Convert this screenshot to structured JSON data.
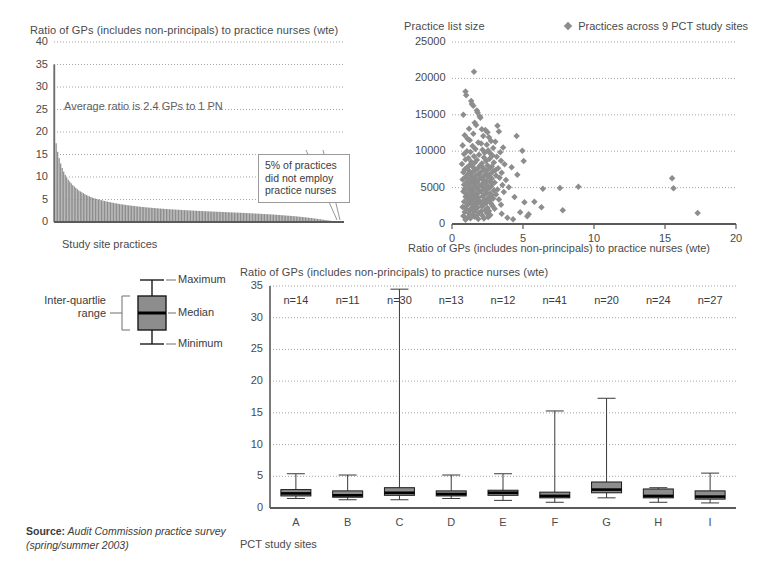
{
  "source": {
    "label": "Source:",
    "text": " Audit Commission practice survey",
    "line2": "(spring/summer 2003)"
  },
  "boxplot_legend": {
    "maximum": "Maximum",
    "median": "Median",
    "minimum": "Minimum",
    "iqr_line1": "Inter-quartlie",
    "iqr_line2": "range"
  },
  "chart_data": [
    {
      "id": "gp-pn-ratio-distribution",
      "type": "bar",
      "title": "Ratio of GPs (includes non-principals) to practice nurses (wte)",
      "xlabel": "Study site practices",
      "ylabel": "",
      "ylim": [
        0,
        40
      ],
      "yticks": [
        0,
        5,
        10,
        15,
        20,
        25,
        30,
        35,
        40
      ],
      "grid": true,
      "annotation": "Average ratio is 2.4 GPs to 1 PN",
      "callout": "5% of practices\ndid not employ\npractice nurses",
      "bar_color": "#8d8d8d",
      "n_bars": 192,
      "values": [
        35.0,
        17.5,
        15.6,
        14.2,
        13.0,
        12.0,
        11.2,
        10.5,
        9.9,
        9.4,
        9.0,
        8.6,
        8.2,
        7.9,
        7.6,
        7.3,
        7.0,
        6.8,
        6.6,
        6.4,
        6.2,
        6.0,
        5.85,
        5.7,
        5.55,
        5.4,
        5.3,
        5.2,
        5.1,
        5.0,
        4.92,
        4.84,
        4.76,
        4.68,
        4.6,
        4.52,
        4.45,
        4.38,
        4.31,
        4.24,
        4.18,
        4.12,
        4.06,
        4.0,
        3.95,
        3.9,
        3.85,
        3.8,
        3.75,
        3.7,
        3.66,
        3.62,
        3.58,
        3.54,
        3.5,
        3.46,
        3.42,
        3.38,
        3.35,
        3.32,
        3.28,
        3.25,
        3.22,
        3.19,
        3.16,
        3.13,
        3.1,
        3.07,
        3.04,
        3.01,
        2.99,
        2.96,
        2.94,
        2.91,
        2.89,
        2.86,
        2.84,
        2.82,
        2.8,
        2.78,
        2.76,
        2.74,
        2.72,
        2.7,
        2.68,
        2.66,
        2.64,
        2.62,
        2.6,
        2.58,
        2.56,
        2.55,
        2.53,
        2.51,
        2.5,
        2.48,
        2.46,
        2.45,
        2.43,
        2.42,
        2.4,
        2.38,
        2.37,
        2.35,
        2.34,
        2.32,
        2.31,
        2.29,
        2.28,
        2.26,
        2.25,
        2.23,
        2.22,
        2.2,
        2.19,
        2.17,
        2.16,
        2.14,
        2.13,
        2.11,
        2.1,
        2.08,
        2.07,
        2.05,
        2.04,
        2.02,
        2.0,
        1.99,
        1.97,
        1.95,
        1.94,
        1.92,
        1.9,
        1.88,
        1.87,
        1.85,
        1.83,
        1.81,
        1.79,
        1.77,
        1.75,
        1.73,
        1.71,
        1.69,
        1.67,
        1.65,
        1.62,
        1.6,
        1.58,
        1.55,
        1.53,
        1.5,
        1.48,
        1.45,
        1.42,
        1.4,
        1.37,
        1.34,
        1.31,
        1.28,
        1.25,
        1.22,
        1.18,
        1.15,
        1.11,
        1.08,
        1.04,
        1.0,
        0.96,
        0.92,
        0.88,
        0.84,
        0.8,
        0.75,
        0.7,
        0.66,
        0.61,
        0.56,
        0.51,
        0.46,
        0.41,
        0.36,
        0.31,
        0.26,
        0.21,
        0.16,
        0.12,
        0.08,
        0.0,
        0.0,
        0.0,
        0.0
      ]
    },
    {
      "id": "list-size-vs-ratio",
      "type": "scatter",
      "title": "Practice list size",
      "xlabel": "Ratio of GPs (includes non-principals) to practice nurses (wte)",
      "ylabel": "Practice list size",
      "legend": "Practices across 9 PCT study sites",
      "legend_position": "top-right",
      "xlim": [
        0,
        20
      ],
      "ylim": [
        0,
        25000
      ],
      "xticks": [
        0,
        5,
        10,
        15,
        20
      ],
      "yticks": [
        0,
        5000,
        10000,
        15000,
        20000,
        25000
      ],
      "grid": true,
      "marker": "diamond",
      "marker_color": "#8d8d8d",
      "points": [
        [
          1.55,
          20900
        ],
        [
          0.95,
          18200
        ],
        [
          1.0,
          17700
        ],
        [
          1.35,
          16900
        ],
        [
          1.4,
          16500
        ],
        [
          1.5,
          16250
        ],
        [
          0.8,
          15000
        ],
        [
          1.75,
          15600
        ],
        [
          1.8,
          15300
        ],
        [
          1.95,
          14800
        ],
        [
          2.0,
          14600
        ],
        [
          1.6,
          13900
        ],
        [
          1.7,
          13600
        ],
        [
          3.2,
          13500
        ],
        [
          3.3,
          12700
        ],
        [
          1.2,
          13100
        ],
        [
          2.1,
          13000
        ],
        [
          2.35,
          12900
        ],
        [
          2.5,
          12600
        ],
        [
          1.5,
          12400
        ],
        [
          0.9,
          12200
        ],
        [
          2.2,
          12100
        ],
        [
          2.6,
          11900
        ],
        [
          1.1,
          11700
        ],
        [
          1.25,
          11500
        ],
        [
          2.75,
          11400
        ],
        [
          3.05,
          11300
        ],
        [
          1.85,
          11200
        ],
        [
          2.05,
          11050
        ],
        [
          2.45,
          10900
        ],
        [
          0.75,
          10800
        ],
        [
          1.45,
          10700
        ],
        [
          3.6,
          10500
        ],
        [
          2.9,
          10450
        ],
        [
          1.65,
          10300
        ],
        [
          2.15,
          10200
        ],
        [
          2.55,
          10100
        ],
        [
          1.05,
          10000
        ],
        [
          1.3,
          9900
        ],
        [
          3.4,
          9850
        ],
        [
          2.3,
          9800
        ],
        [
          2.7,
          9700
        ],
        [
          0.85,
          9600
        ],
        [
          1.9,
          9500
        ],
        [
          2.85,
          9400
        ],
        [
          1.55,
          9300
        ],
        [
          3.15,
          9250
        ],
        [
          2.25,
          9150
        ],
        [
          1.15,
          9050
        ],
        [
          2.65,
          8950
        ],
        [
          0.95,
          8850
        ],
        [
          1.75,
          8800
        ],
        [
          3.45,
          8700
        ],
        [
          2.4,
          8650
        ],
        [
          1.35,
          8550
        ],
        [
          2.95,
          8450
        ],
        [
          1.6,
          8400
        ],
        [
          2.1,
          8300
        ],
        [
          0.7,
          8250
        ],
        [
          3.7,
          8200
        ],
        [
          1.25,
          8100
        ],
        [
          2.5,
          8050
        ],
        [
          1.95,
          7950
        ],
        [
          2.8,
          7900
        ],
        [
          1.45,
          7850
        ],
        [
          4.2,
          7800
        ],
        [
          1.05,
          7750
        ],
        [
          2.2,
          7700
        ],
        [
          3.25,
          7650
        ],
        [
          1.8,
          7600
        ],
        [
          2.6,
          7550
        ],
        [
          0.9,
          7500
        ],
        [
          1.65,
          7450
        ],
        [
          3.05,
          7400
        ],
        [
          2.35,
          7350
        ],
        [
          1.2,
          7300
        ],
        [
          2.9,
          7250
        ],
        [
          1.5,
          7200
        ],
        [
          2.05,
          7150
        ],
        [
          0.8,
          7100
        ],
        [
          3.5,
          7050
        ],
        [
          1.35,
          7000
        ],
        [
          2.45,
          6950
        ],
        [
          1.9,
          6900
        ],
        [
          2.7,
          6850
        ],
        [
          1.1,
          6800
        ],
        [
          4.6,
          6750
        ],
        [
          1.7,
          6700
        ],
        [
          3.1,
          6650
        ],
        [
          2.25,
          6600
        ],
        [
          1.4,
          6550
        ],
        [
          2.55,
          6500
        ],
        [
          0.95,
          6450
        ],
        [
          2.0,
          6400
        ],
        [
          3.35,
          6350
        ],
        [
          1.6,
          6300
        ],
        [
          2.8,
          6250
        ],
        [
          1.25,
          6200
        ],
        [
          2.15,
          6150
        ],
        [
          0.75,
          6100
        ],
        [
          3.8,
          6050
        ],
        [
          1.85,
          6000
        ],
        [
          2.4,
          5950
        ],
        [
          1.45,
          5900
        ],
        [
          2.65,
          5850
        ],
        [
          1.05,
          5800
        ],
        [
          1.75,
          5750
        ],
        [
          3.0,
          5700
        ],
        [
          2.3,
          5650
        ],
        [
          1.3,
          5600
        ],
        [
          2.85,
          5550
        ],
        [
          1.55,
          5500
        ],
        [
          2.1,
          5450
        ],
        [
          0.85,
          5400
        ],
        [
          3.55,
          5350
        ],
        [
          1.95,
          5300
        ],
        [
          2.5,
          5250
        ],
        [
          1.15,
          5200
        ],
        [
          2.75,
          5150
        ],
        [
          1.65,
          5100
        ],
        [
          4.0,
          5050
        ],
        [
          2.2,
          5000
        ],
        [
          1.4,
          4950
        ],
        [
          2.6,
          4900
        ],
        [
          0.9,
          4850
        ],
        [
          1.8,
          4800
        ],
        [
          3.2,
          4750
        ],
        [
          2.35,
          4700
        ],
        [
          1.2,
          4650
        ],
        [
          2.95,
          4600
        ],
        [
          1.5,
          4550
        ],
        [
          2.05,
          4500
        ],
        [
          0.8,
          4450
        ],
        [
          3.65,
          4400
        ],
        [
          1.9,
          4350
        ],
        [
          2.45,
          4300
        ],
        [
          1.35,
          4250
        ],
        [
          2.7,
          4200
        ],
        [
          1.0,
          4150
        ],
        [
          1.7,
          4100
        ],
        [
          3.1,
          4050
        ],
        [
          2.25,
          4000
        ],
        [
          1.25,
          3950
        ],
        [
          2.8,
          3900
        ],
        [
          1.55,
          3850
        ],
        [
          2.15,
          3800
        ],
        [
          0.95,
          3750
        ],
        [
          4.4,
          3700
        ],
        [
          1.85,
          3650
        ],
        [
          2.55,
          3600
        ],
        [
          1.45,
          3550
        ],
        [
          2.9,
          3500
        ],
        [
          1.1,
          3450
        ],
        [
          1.75,
          3400
        ],
        [
          3.3,
          3350
        ],
        [
          2.3,
          3300
        ],
        [
          1.3,
          3250
        ],
        [
          2.65,
          3200
        ],
        [
          1.6,
          3150
        ],
        [
          2.0,
          3100
        ],
        [
          0.85,
          3050
        ],
        [
          5.1,
          3000
        ],
        [
          1.95,
          2950
        ],
        [
          2.4,
          2900
        ],
        [
          1.15,
          2850
        ],
        [
          2.75,
          2800
        ],
        [
          1.4,
          2750
        ],
        [
          1.7,
          2700
        ],
        [
          3.45,
          2650
        ],
        [
          2.2,
          2600
        ],
        [
          1.05,
          2550
        ],
        [
          2.85,
          2500
        ],
        [
          1.5,
          2450
        ],
        [
          2.1,
          2400
        ],
        [
          0.75,
          2350
        ],
        [
          6.3,
          2300
        ],
        [
          1.8,
          2250
        ],
        [
          2.5,
          2200
        ],
        [
          1.35,
          2150
        ],
        [
          3.0,
          2100
        ],
        [
          1.0,
          2050
        ],
        [
          1.65,
          2000
        ],
        [
          2.35,
          1950
        ],
        [
          7.8,
          1900
        ],
        [
          1.25,
          1850
        ],
        [
          2.6,
          1800
        ],
        [
          1.55,
          1750
        ],
        [
          2.05,
          1700
        ],
        [
          0.9,
          1650
        ],
        [
          4.8,
          1600
        ],
        [
          1.9,
          1550
        ],
        [
          2.45,
          1500
        ],
        [
          1.2,
          1450
        ],
        [
          3.5,
          1400
        ],
        [
          5.4,
          1350
        ],
        [
          1.45,
          1300
        ],
        [
          2.7,
          1250
        ],
        [
          1.75,
          1200
        ],
        [
          2.15,
          1150
        ],
        [
          0.8,
          1100
        ],
        [
          5.3,
          1050
        ],
        [
          1.6,
          1000
        ],
        [
          2.55,
          950
        ],
        [
          1.1,
          900
        ],
        [
          3.9,
          850
        ],
        [
          1.3,
          800
        ],
        [
          2.25,
          750
        ],
        [
          1.85,
          700
        ],
        [
          4.3,
          650
        ],
        [
          0.95,
          600
        ],
        [
          15.5,
          6300
        ],
        [
          17.3,
          1500
        ],
        [
          15.6,
          4900
        ],
        [
          8.9,
          5100
        ],
        [
          7.6,
          4950
        ],
        [
          6.4,
          4850
        ],
        [
          5.8,
          3050
        ],
        [
          5.05,
          8650
        ],
        [
          4.95,
          10050
        ],
        [
          4.55,
          12100
        ]
      ]
    },
    {
      "id": "ratio-by-pct-site",
      "type": "box",
      "title": "Ratio of GPs (includes non-principals) to practice nurses (wte)",
      "xlabel": "PCT study sites",
      "ylabel": "",
      "ylim": [
        0,
        35
      ],
      "yticks": [
        0,
        5,
        10,
        15,
        20,
        25,
        30,
        35
      ],
      "grid": true,
      "categories": [
        "A",
        "B",
        "C",
        "D",
        "E",
        "F",
        "G",
        "H",
        "I"
      ],
      "counts": [
        "n=14",
        "n=11",
        "n=30",
        "n=13",
        "n=12",
        "n=41",
        "n=20",
        "n=24",
        "n=27"
      ],
      "boxes": [
        {
          "category": "A",
          "min": 1.5,
          "q1": 1.9,
          "median": 2.3,
          "q3": 2.9,
          "max": 5.4
        },
        {
          "category": "B",
          "min": 1.3,
          "q1": 1.7,
          "median": 2.0,
          "q3": 2.7,
          "max": 5.2
        },
        {
          "category": "C",
          "min": 1.3,
          "q1": 2.0,
          "median": 2.4,
          "q3": 3.2,
          "max": 34.5
        },
        {
          "category": "D",
          "min": 1.5,
          "q1": 1.9,
          "median": 2.2,
          "q3": 2.7,
          "max": 5.2
        },
        {
          "category": "E",
          "min": 1.2,
          "q1": 2.0,
          "median": 2.4,
          "q3": 2.8,
          "max": 5.4
        },
        {
          "category": "F",
          "min": 0.9,
          "q1": 1.6,
          "median": 1.9,
          "q3": 2.5,
          "max": 15.3
        },
        {
          "category": "G",
          "min": 1.6,
          "q1": 2.4,
          "median": 2.9,
          "q3": 4.1,
          "max": 17.3
        },
        {
          "category": "H",
          "min": 0.9,
          "q1": 1.6,
          "median": 1.9,
          "q3": 3.0,
          "max": 3.2
        },
        {
          "category": "I",
          "min": 0.8,
          "q1": 1.4,
          "median": 1.8,
          "q3": 2.7,
          "max": 5.5
        }
      ],
      "box_fill": "#8d8d8d",
      "box_stroke": "#1a1a1a"
    }
  ]
}
